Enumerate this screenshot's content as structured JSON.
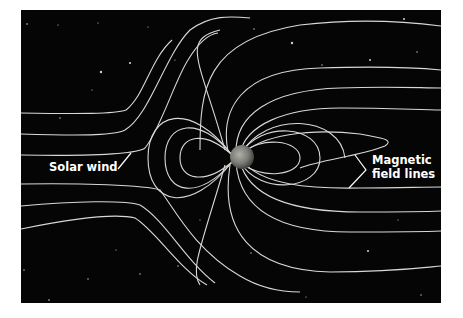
{
  "diagram": {
    "background_color": "#050505",
    "line_color": "#d8d8d8",
    "center_object": "Earth",
    "labels": {
      "solar_wind": "Solar wind",
      "magnetic_line1": "Magnetic",
      "magnetic_line2": "field lines"
    }
  }
}
